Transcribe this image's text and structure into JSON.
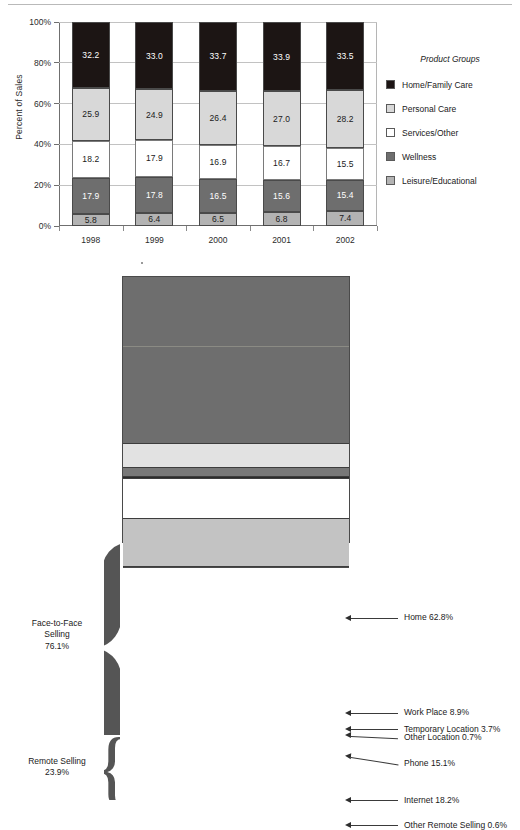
{
  "chart_data": [
    {
      "type": "bar",
      "subtype": "stacked-100-percent",
      "title": "",
      "xlabel": "",
      "ylabel": "Percent of Sales",
      "ylim": [
        0,
        100
      ],
      "ytick_labels": [
        "0%",
        "20%",
        "40%",
        "60%",
        "80%",
        "100%"
      ],
      "ytick_values": [
        0,
        20,
        40,
        60,
        80,
        100
      ],
      "grid": true,
      "legend_position": "right",
      "legend_title": "Product Groups",
      "categories": [
        "1998",
        "1999",
        "2000",
        "2001",
        "2002"
      ],
      "series": [
        {
          "name": "Leisure/Educational",
          "color": "#b3b3b3",
          "text_color": "dark",
          "values": [
            5.8,
            6.4,
            6.5,
            6.8,
            7.4
          ],
          "labels": [
            "5.8",
            "6.4",
            "6.5",
            "6.8",
            "7.4"
          ]
        },
        {
          "name": "Wellness",
          "color": "#6e6e6e",
          "text_color": "light",
          "values": [
            17.9,
            17.8,
            16.5,
            15.6,
            15.4
          ],
          "labels": [
            "17.9",
            "17.8",
            "16.5",
            "15.6",
            "15.4"
          ]
        },
        {
          "name": "Services/Other",
          "color": "#ffffff",
          "text_color": "dark",
          "values": [
            18.2,
            17.9,
            16.9,
            16.7,
            15.5
          ],
          "labels": [
            "18.2",
            "17.9",
            "16.9",
            "16.7",
            "15.5"
          ]
        },
        {
          "name": "Personal Care",
          "color": "#d8d8d8",
          "text_color": "dark",
          "values": [
            25.9,
            24.9,
            26.4,
            27.0,
            28.2
          ],
          "labels": [
            "25.9",
            "24.9",
            "26.4",
            "27.0",
            "28.2"
          ]
        },
        {
          "name": "Home/Family Care",
          "color": "#1c1514",
          "text_color": "light",
          "values": [
            32.2,
            33.0,
            33.7,
            33.9,
            33.5
          ],
          "labels": [
            "32.2",
            "33.0",
            "33.7",
            "33.9",
            "33.5"
          ]
        }
      ],
      "legend_entries": [
        {
          "label": "Home/Family Care",
          "color": "#1c1514"
        },
        {
          "label": "Personal Care",
          "color": "#d8d8d8"
        },
        {
          "label": "Services/Other",
          "color": "#ffffff"
        },
        {
          "label": "Wellness",
          "color": "#6e6e6e"
        },
        {
          "label": "Leisure/Educational",
          "color": "#b3b3b3"
        }
      ]
    },
    {
      "type": "bar",
      "subtype": "single-stacked-band",
      "title": "",
      "orientation": "vertical-band",
      "groups": [
        {
          "name": "Face-to-Face Selling",
          "label_line1": "Face-to-Face",
          "label_line2": "Selling",
          "label_line3": "76.1%",
          "value": 76.1
        },
        {
          "name": "Remote Selling",
          "label_line1": "Remote Selling",
          "label_line2": "23.9%",
          "label_line3": "",
          "value": 23.9
        }
      ],
      "categories": [
        "Home",
        "Work Place",
        "Temporary Location",
        "Other Location",
        "Phone",
        "Internet",
        "Other Remote Selling"
      ],
      "values": [
        62.8,
        8.9,
        3.7,
        0.7,
        15.1,
        18.2,
        0.6
      ],
      "callouts": [
        {
          "label": "Home 62.8%",
          "color": "#6e6e6e"
        },
        {
          "label": "Work Place 8.9%",
          "color": "#e2e2e2"
        },
        {
          "label": "Temporary Location 3.7%",
          "color": "#787878"
        },
        {
          "label": "Other Location 0.7%",
          "color": "#2b2b2b"
        },
        {
          "label": "Phone 15.1%",
          "color": "#ffffff"
        },
        {
          "label": "Internet 18.2%",
          "color": "#c3c3c3"
        },
        {
          "label": "Other Remote Selling 0.6%",
          "color": "#4a4a4a"
        }
      ]
    }
  ]
}
